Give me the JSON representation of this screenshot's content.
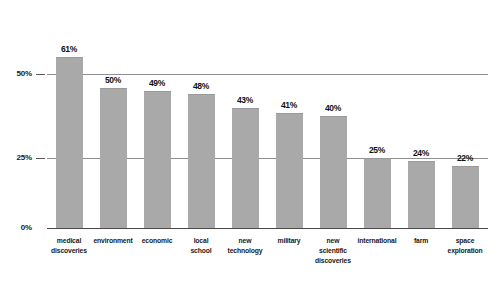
{
  "chart_data": {
    "type": "bar",
    "title": "",
    "subtitle": "",
    "xlabel": "",
    "ylabel": "",
    "ylim": [
      0,
      70
    ],
    "grid": true,
    "legend": "none",
    "orientation": "vertical",
    "value_label_format": "percent",
    "bar_color": "#a9a9a9",
    "gridline_color": "#8f8f8f",
    "axis_color": "#4a4a4a",
    "background_color": "#ffffff",
    "ytick_labels": [
      "0%",
      "25%",
      "50%"
    ],
    "ytick_values": [
      0,
      25,
      50
    ],
    "categories": [
      "medical discoveries",
      "environment",
      "economic",
      "local school",
      "new technology",
      "military",
      "new scientific discoveries",
      "international",
      "farm",
      "space exploration"
    ],
    "category_lines": [
      [
        "medical",
        "discoveries"
      ],
      [
        "environment"
      ],
      [
        "economic"
      ],
      [
        "local",
        "school"
      ],
      [
        "new",
        "technology"
      ],
      [
        "military"
      ],
      [
        "new",
        "scientific",
        "discoveries"
      ],
      [
        "international"
      ],
      [
        "farm"
      ],
      [
        "space",
        "exploration"
      ]
    ],
    "values": [
      61,
      50,
      49,
      48,
      43,
      41,
      40,
      25,
      24,
      22
    ],
    "value_labels": [
      "61%",
      "50%",
      "49%",
      "48%",
      "43%",
      "41%",
      "40%",
      "25%",
      "24%",
      "22%"
    ]
  }
}
